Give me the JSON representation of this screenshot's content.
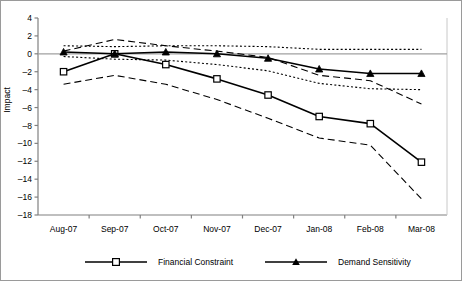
{
  "chart_data": {
    "type": "line",
    "title": "",
    "xlabel": "",
    "ylabel": "Impact",
    "categories": [
      "Aug-07",
      "Sep-07",
      "Oct-07",
      "Nov-07",
      "Dec-07",
      "Jan-08",
      "Feb-08",
      "Mar-08"
    ],
    "ylim": [
      -18,
      4
    ],
    "ytick_labels": [
      "4",
      "2",
      "0",
      "-2",
      "-4",
      "-6",
      "-8",
      "-10",
      "-12",
      "-14",
      "-16",
      "-18"
    ],
    "ytick_values": [
      4,
      2,
      0,
      -2,
      -4,
      -6,
      -8,
      -10,
      -12,
      -14,
      -16,
      -18
    ],
    "grid": false,
    "zero_line": true,
    "legend_position": "bottom",
    "series": [
      {
        "name": "Financial Constraint",
        "marker": "open-square",
        "style": "solid",
        "values": [
          -2.0,
          0.0,
          -1.2,
          -2.8,
          -4.6,
          -7.0,
          -7.8,
          -12.1
        ]
      },
      {
        "name": "Demand Sensitivity",
        "marker": "filled-triangle",
        "style": "solid",
        "values": [
          0.2,
          0.0,
          0.2,
          0.0,
          -0.5,
          -1.7,
          -2.2,
          -2.2
        ]
      },
      {
        "name": "Financial Constraint upper bound",
        "marker": "none",
        "style": "dashed",
        "values": [
          0.3,
          1.6,
          0.9,
          0.3,
          -0.4,
          -2.4,
          -3.0,
          -5.6
        ]
      },
      {
        "name": "Financial Constraint lower bound",
        "marker": "none",
        "style": "dashed",
        "values": [
          -3.4,
          -2.4,
          -3.4,
          -5.1,
          -7.2,
          -9.4,
          -10.2,
          -16.2
        ]
      },
      {
        "name": "Demand Sensitivity upper bound",
        "marker": "none",
        "style": "dotted",
        "values": [
          0.9,
          0.8,
          0.9,
          0.9,
          0.8,
          0.5,
          0.5,
          0.5
        ]
      },
      {
        "name": "Demand Sensitivity lower bound",
        "marker": "none",
        "style": "dotted",
        "values": [
          -0.3,
          -0.6,
          -0.7,
          -1.2,
          -1.9,
          -3.3,
          -3.9,
          -4.0
        ]
      }
    ]
  },
  "legend": {
    "items": [
      {
        "label": "Financial Constraint",
        "marker": "open-square"
      },
      {
        "label": "Demand Sensitivity",
        "marker": "filled-triangle"
      }
    ]
  }
}
